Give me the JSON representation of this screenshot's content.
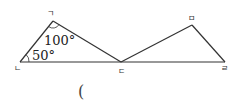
{
  "figure": {
    "vertices": {
      "g": {
        "label": "ㄱ",
        "x": 53,
        "y": 21
      },
      "n": {
        "label": "ㄴ",
        "x": 20,
        "y": 62
      },
      "d": {
        "label": "ㄷ",
        "x": 121,
        "y": 62
      },
      "m": {
        "label": "ㅁ",
        "x": 192,
        "y": 25
      },
      "r": {
        "label": "ㄹ",
        "x": 225,
        "y": 62
      }
    },
    "angles": {
      "at_g": "100°",
      "at_n": "50°"
    },
    "stroke_color": "#333333"
  },
  "answer": {
    "open_paren": "("
  }
}
